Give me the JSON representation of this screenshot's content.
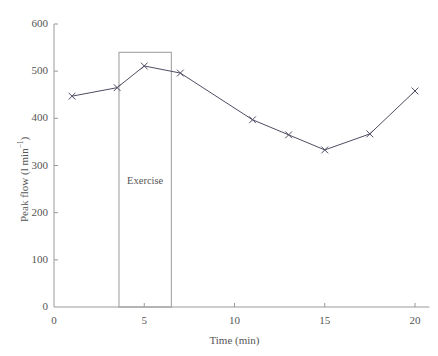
{
  "chart_data": {
    "type": "line",
    "title": "",
    "xlabel": "Time (min)",
    "ylabel_text": "Peak flow (l min",
    "ylabel_sup": "−1",
    "ylabel_tail": ")",
    "ylabel_full": "Peak flow (l min⁻¹)",
    "xlim": [
      0,
      20.8
    ],
    "ylim": [
      0,
      620
    ],
    "xticks": [
      0,
      5,
      10,
      15,
      20
    ],
    "xtick_labels": [
      "0",
      "5",
      "10",
      "15",
      "20"
    ],
    "yticks": [
      0,
      100,
      200,
      300,
      400,
      500,
      600
    ],
    "ytick_labels": [
      "0",
      "100",
      "200",
      "300",
      "400",
      "500",
      "600"
    ],
    "grid": false,
    "legend": null,
    "marker": "x",
    "line_color": "#4d4d63",
    "marker_color": "#4d4d63",
    "axis_color": "#9a9a9a",
    "text_color": "#555555",
    "x": [
      1,
      3.5,
      5,
      7,
      11,
      13,
      15,
      17.5,
      20
    ],
    "values": [
      447,
      465,
      511,
      496,
      397,
      365,
      333,
      367,
      458
    ],
    "series": [
      {
        "name": "Peak flow",
        "x": [
          1,
          3.5,
          5,
          7,
          11,
          13,
          15,
          17.5,
          20
        ],
        "values": [
          447,
          465,
          511,
          496,
          397,
          365,
          333,
          367,
          458
        ]
      }
    ],
    "annotations": [
      {
        "name": "exercise-period",
        "label": "Exercise",
        "type": "box",
        "x_start": 3.6,
        "x_end": 6.5,
        "y_start": 0,
        "y_end": 540,
        "label_x": 5.05,
        "label_y": 265,
        "border_color": "#9a9a9a"
      }
    ]
  }
}
